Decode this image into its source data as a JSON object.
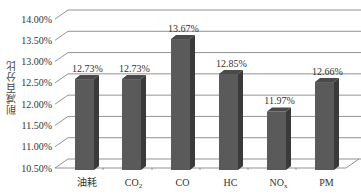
{
  "chart_data": {
    "type": "bar",
    "style": "3d-column",
    "title": "",
    "xlabel": "",
    "ylabel": "削减百分比",
    "categories": [
      "油耗",
      "CO2",
      "CO",
      "HC",
      "NOx",
      "PM"
    ],
    "category_display": [
      {
        "base": "油耗",
        "sub": ""
      },
      {
        "base": "CO",
        "sub": "2"
      },
      {
        "base": "CO",
        "sub": ""
      },
      {
        "base": "HC",
        "sub": ""
      },
      {
        "base": "NO",
        "sub": "x"
      },
      {
        "base": "PM",
        "sub": ""
      }
    ],
    "values": [
      12.73,
      12.73,
      13.67,
      12.85,
      11.97,
      12.66
    ],
    "value_labels": [
      "12.73%",
      "12.73%",
      "13.67%",
      "12.85%",
      "11.97%",
      "12.66%"
    ],
    "ylim": [
      10.5,
      14.0
    ],
    "yticks": [
      "10.50%",
      "11.00%",
      "11.50%",
      "12.00%",
      "12.50%",
      "13.00%",
      "13.50%",
      "14.00%"
    ],
    "grid": true,
    "legend": null,
    "bar_color": "#5a5a5a"
  }
}
